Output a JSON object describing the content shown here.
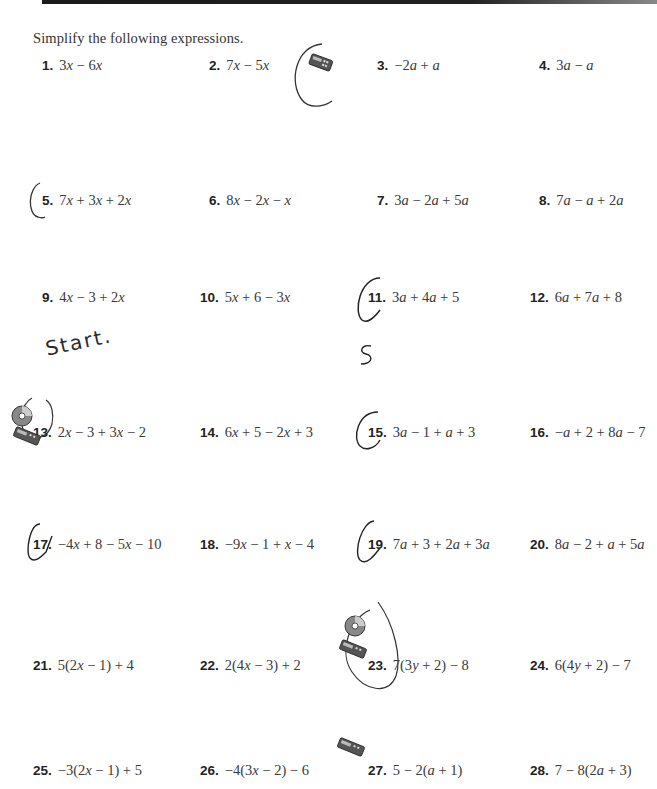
{
  "page": {
    "instruction": "Simplify the following expressions."
  },
  "problems": [
    {
      "number": "1.",
      "expression": "3x − 6x"
    },
    {
      "number": "2.",
      "expression": "7x − 5x"
    },
    {
      "number": "3.",
      "expression": "−2a + a"
    },
    {
      "number": "4.",
      "expression": "3a − a"
    },
    {
      "number": "5.",
      "expression": "7x + 3x + 2x"
    },
    {
      "number": "6.",
      "expression": "8x − 2x − x"
    },
    {
      "number": "7.",
      "expression": "3a − 2a + 5a"
    },
    {
      "number": "8.",
      "expression": "7a − a + 2a"
    },
    {
      "number": "9.",
      "expression": "4x − 3 + 2x"
    },
    {
      "number": "10.",
      "expression": "5x + 6 − 3x"
    },
    {
      "number": "11.",
      "expression": "3a + 4a + 5"
    },
    {
      "number": "12.",
      "expression": "6a + 7a + 8"
    },
    {
      "number": "13.",
      "expression": "2x − 3 + 3x − 2"
    },
    {
      "number": "14.",
      "expression": "6x + 5 − 2x + 3"
    },
    {
      "number": "15.",
      "expression": "3a − 1 + a + 3"
    },
    {
      "number": "16.",
      "expression": "−a + 2 + 8a − 7"
    },
    {
      "number": "17.",
      "expression": "−4x + 8 − 5x − 10"
    },
    {
      "number": "18.",
      "expression": "−9x − 1 + x − 4"
    },
    {
      "number": "19.",
      "expression": "7a + 3 + 2a + 3a"
    },
    {
      "number": "20.",
      "expression": "8a − 2 + a + 5a"
    },
    {
      "number": "21.",
      "expression": "5(2x − 1) + 4"
    },
    {
      "number": "22.",
      "expression": "2(4x − 3) + 2"
    },
    {
      "number": "23.",
      "expression": "7(3y + 2) − 8"
    },
    {
      "number": "24.",
      "expression": "6(4y + 2) − 7"
    },
    {
      "number": "25.",
      "expression": "−3(2x − 1) + 5"
    },
    {
      "number": "26.",
      "expression": "−4(3x − 2) − 6"
    },
    {
      "number": "27.",
      "expression": "5 − 2(a + 1)"
    },
    {
      "number": "28.",
      "expression": "7 − 8(2a + 3)"
    }
  ],
  "handwriting": {
    "start_note": "Start.",
    "answer_11": "S"
  },
  "icons": {
    "calculator": "calculator-icon",
    "cd": "cd-icon"
  },
  "colors": {
    "ink": "#2b2b2b",
    "rule": "#1a1a1a",
    "background": "#ffffff"
  }
}
